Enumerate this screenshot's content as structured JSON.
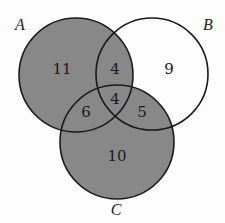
{
  "diagram": {
    "type": "venn",
    "sets": [
      {
        "label": "A",
        "cx": 76,
        "cy": 75,
        "r": 57,
        "label_x": 20,
        "label_y": 30
      },
      {
        "label": "B",
        "cx": 152,
        "cy": 74,
        "r": 56,
        "label_x": 208,
        "label_y": 30
      },
      {
        "label": "C",
        "cx": 117,
        "cy": 142,
        "r": 57,
        "label_x": 116,
        "label_y": 215
      }
    ],
    "shaded": "A ∪ C",
    "shade_color": "#888888",
    "stroke_color": "#1a1a1a",
    "regions": [
      {
        "name": "A only",
        "value": "11",
        "x": 62,
        "y": 74
      },
      {
        "name": "A ∩ B only",
        "value": "4",
        "x": 115,
        "y": 74
      },
      {
        "name": "B only",
        "value": "9",
        "x": 169,
        "y": 74
      },
      {
        "name": "A ∩ B ∩ C",
        "value": "4",
        "x": 115,
        "y": 104
      },
      {
        "name": "A ∩ C only",
        "value": "6",
        "x": 86,
        "y": 117
      },
      {
        "name": "B ∩ C only",
        "value": "5",
        "x": 142,
        "y": 117
      },
      {
        "name": "C only",
        "value": "10",
        "x": 117,
        "y": 161
      }
    ]
  }
}
